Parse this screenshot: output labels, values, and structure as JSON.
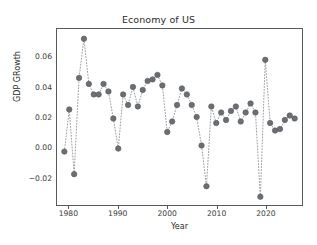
{
  "chart_data": {
    "type": "scatter",
    "title": "Economy of US",
    "xlabel": "Year",
    "ylabel": "GDP GRowth",
    "xlim": [
      1977.5,
      2027.5
    ],
    "ylim": [
      -0.0385,
      0.0785
    ],
    "grid": false,
    "legend": null,
    "marker": {
      "style": "circle",
      "color": "#6b6f74",
      "size": 5.5,
      "edge_color": "#54585c"
    },
    "line": {
      "style": "dotted",
      "color": "#9a9da1",
      "width": 1.0
    },
    "xticks": [
      1980,
      1990,
      2000,
      2010,
      2020
    ],
    "xtick_labels": [
      "1980",
      "1990",
      "2000",
      "2010",
      "2020"
    ],
    "yticks": [
      -0.02,
      0.0,
      0.02,
      0.04,
      0.06
    ],
    "ytick_labels": [
      "−0.02",
      "0.00",
      "0.02",
      "0.04",
      "0.06"
    ],
    "x": [
      1979,
      1980,
      1981,
      1982,
      1983,
      1984,
      1985,
      1986,
      1987,
      1988,
      1989,
      1990,
      1991,
      1992,
      1993,
      1994,
      1995,
      1996,
      1997,
      1998,
      1999,
      2000,
      2001,
      2002,
      2003,
      2004,
      2005,
      2006,
      2007,
      2008,
      2009,
      2010,
      2011,
      2012,
      2013,
      2014,
      2015,
      2016,
      2017,
      2018,
      2019,
      2020,
      2021,
      2022,
      2023,
      2024,
      2025,
      2026
    ],
    "values": [
      -0.003,
      0.025,
      -0.018,
      0.046,
      0.072,
      0.042,
      0.035,
      0.035,
      0.042,
      0.037,
      0.019,
      -0.001,
      0.035,
      0.028,
      0.04,
      0.027,
      0.038,
      0.044,
      0.045,
      0.048,
      0.041,
      0.01,
      0.017,
      0.028,
      0.039,
      0.035,
      0.028,
      0.02,
      0.001,
      -0.026,
      0.027,
      0.016,
      0.023,
      0.018,
      0.024,
      0.027,
      0.017,
      0.023,
      0.029,
      0.023,
      -0.033,
      0.058,
      0.016,
      0.011,
      0.012,
      0.018,
      0.021,
      0.019
    ]
  }
}
